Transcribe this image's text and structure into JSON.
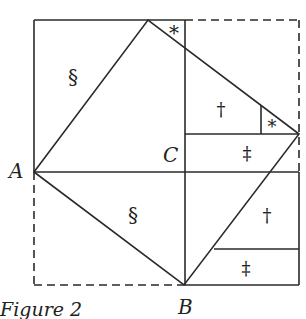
{
  "caption": "Figure 2",
  "points": {
    "A": {
      "label": "A",
      "x": 34,
      "y": 172
    },
    "B": {
      "label": "B",
      "x": 184,
      "y": 285
    },
    "C": {
      "label": "C",
      "x": 185,
      "y": 172
    }
  },
  "region_marks": {
    "section_top": "§",
    "dagger_top": "†",
    "asterisk_top": "*",
    "asterisk_right": "*",
    "ddagger_mid": "‡",
    "section_bottom": "§",
    "dagger_bottom": "†",
    "ddagger_bottom": "‡"
  },
  "colors": {
    "stroke": "#2a2a2a",
    "background": "#ffffff"
  }
}
